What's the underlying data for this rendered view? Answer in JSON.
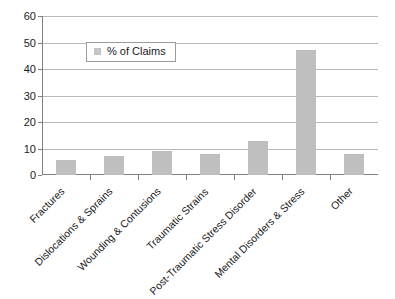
{
  "chart_data": {
    "type": "bar",
    "title": "",
    "subtitle": "",
    "xlabel": "",
    "ylabel": "",
    "categories": [
      "Fractures",
      "Dislocations & Sprains",
      "Wounding & Contusions",
      "Traumatic Strains",
      "Post-Traumatic Stress Disorder",
      "Mental Disorders & Stress",
      "Other"
    ],
    "series": [
      {
        "name": "% of Claims",
        "values": [
          5.5,
          7,
          9,
          8,
          13,
          47,
          8
        ],
        "color": "#bfbfbf"
      }
    ],
    "ylim": [
      0,
      60
    ],
    "yticks": [
      0,
      10,
      20,
      30,
      40,
      50,
      60
    ],
    "ytick_labels": [
      "0",
      "10",
      "20",
      "30",
      "40",
      "50",
      "60"
    ],
    "grid": true,
    "grid_axis": "y",
    "legend": {
      "position": "upper-left-inside",
      "entries": [
        {
          "label": "% of Claims",
          "color": "#c6c6c6"
        }
      ]
    },
    "axis_color": "#808080",
    "gridline_color": "#b9b9b9",
    "background": "#ffffff"
  }
}
